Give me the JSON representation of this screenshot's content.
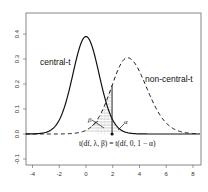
{
  "chart_data": {
    "type": "line",
    "title": "",
    "xlabel": "",
    "ylabel": "",
    "xlim": [
      -4.5,
      8.5
    ],
    "ylim": [
      -0.14,
      0.49
    ],
    "grid": false,
    "x_ticks": [
      -4,
      -2,
      0,
      2,
      4,
      6,
      8
    ],
    "x_tick_labels": [
      "-4",
      "-2",
      "0",
      "2",
      "4",
      "6",
      "8"
    ],
    "y_ticks": [
      -0.1,
      0.0,
      0.1,
      0.2,
      0.3,
      0.4
    ],
    "y_tick_labels": [
      "-0.1",
      "0.0",
      "0.1",
      "0.2",
      "0.3",
      "0.4"
    ],
    "series": [
      {
        "name": "central-t",
        "style": "solid",
        "df": 30,
        "ncp": 0,
        "peak_x": 0,
        "peak_y": 0.39,
        "x": [
          -4,
          -3,
          -2,
          -1.5,
          -1,
          -0.5,
          0,
          0.5,
          1,
          1.5,
          2,
          3,
          4,
          6,
          8
        ],
        "y": [
          0.0003,
          0.006,
          0.055,
          0.13,
          0.24,
          0.35,
          0.39,
          0.35,
          0.24,
          0.13,
          0.055,
          0.006,
          0.0003,
          0,
          0
        ]
      },
      {
        "name": "non-central-t",
        "style": "dashed",
        "df": 30,
        "ncp": 3.1,
        "peak_x": 3.1,
        "peak_y": 0.305,
        "x": [
          -4,
          -1,
          0,
          1,
          1.5,
          2,
          2.5,
          3,
          3.5,
          4,
          5,
          6,
          7,
          8
        ],
        "y": [
          0,
          0.0006,
          0.006,
          0.045,
          0.1,
          0.17,
          0.25,
          0.3,
          0.29,
          0.24,
          0.12,
          0.045,
          0.015,
          0.005
        ]
      }
    ],
    "critical_value": {
      "x": 1.95,
      "label": "t(df, λ, β) = t(df, 0, 1 − α)"
    },
    "shaded_regions": [
      {
        "name": "beta",
        "label": "β",
        "under": "non-central-t",
        "from": -4.5,
        "to": 1.95
      },
      {
        "name": "alpha",
        "label": "α",
        "under": "central-t",
        "from": 1.95,
        "to": 8.5
      }
    ],
    "annotations": [
      {
        "text": "central-t",
        "x": -3.5,
        "y": 0.29
      },
      {
        "text": "non-central-t",
        "x": 4.5,
        "y": 0.22
      }
    ]
  },
  "labels": {
    "central": "central-t",
    "noncentral": "non-central-t",
    "beta": "β",
    "alpha": "α",
    "critical": "t(df, λ, β) = t(df, 0, 1 − α)"
  },
  "colors": {
    "line": "#111111",
    "frame": "#555555",
    "hatch": "#888888"
  }
}
